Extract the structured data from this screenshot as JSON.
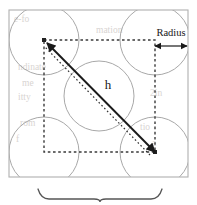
{
  "figure": {
    "name": "sphere-packing-unit-cell-diagram",
    "type": "geometric-diagram",
    "width": 197,
    "height": 205,
    "background_color": "#ffffff"
  },
  "labels": {
    "radius": "Radius",
    "h": "h"
  },
  "colors": {
    "outline": "#b0b0b0",
    "circle_stroke": "#a8a8a8",
    "dashed_stroke": "#3a3a3a",
    "arrow_stroke": "#1a1a1a",
    "brace_stroke": "#555555",
    "text": "#171717",
    "background_bleed_text": "#b9b2ad"
  },
  "geometry": {
    "outer_square": {
      "x": 9,
      "y": 10,
      "width": 179,
      "height": 167
    },
    "inner_dashed_square": {
      "x": 44,
      "y": 40,
      "width": 111,
      "height": 112
    },
    "circle_radius": 35,
    "circles": [
      {
        "name": "circle-top-left",
        "cx": 44,
        "cy": 40
      },
      {
        "name": "circle-top-right",
        "cx": 155,
        "cy": 40
      },
      {
        "name": "circle-center",
        "cx": 99,
        "cy": 96
      },
      {
        "name": "circle-bottom-left",
        "cx": 44,
        "cy": 152
      },
      {
        "name": "circle-bottom-right",
        "cx": 155,
        "cy": 152
      }
    ],
    "diagonal_arrow": {
      "x1": 155,
      "y1": 152,
      "x2": 47,
      "y2": 43,
      "double_headed": true
    },
    "diagonal_dotted": {
      "x1": 150,
      "y1": 155,
      "x2": 45,
      "y2": 47
    },
    "radius_dimension": {
      "x1": 155,
      "y1": 46,
      "x2": 187,
      "y2": 46
    },
    "bottom_brace": {
      "x1": 38,
      "x2": 162,
      "y": 189,
      "peak_y": 202
    }
  },
  "background_bleed": [
    {
      "text": "e-fo",
      "x": 14,
      "y": 22
    },
    {
      "text": "mation",
      "x": 96,
      "y": 33
    },
    {
      "text": "ndinate",
      "x": 18,
      "y": 70
    },
    {
      "text": "me",
      "x": 22,
      "y": 86
    },
    {
      "text": "itty",
      "x": 18,
      "y": 100
    },
    {
      "text": "2in",
      "x": 150,
      "y": 96
    },
    {
      "text": "rom",
      "x": 20,
      "y": 126
    },
    {
      "text": "f",
      "x": 16,
      "y": 142
    },
    {
      "text": "tio",
      "x": 140,
      "y": 130
    },
    {
      "text": "a",
      "x": 152,
      "y": 146
    }
  ]
}
